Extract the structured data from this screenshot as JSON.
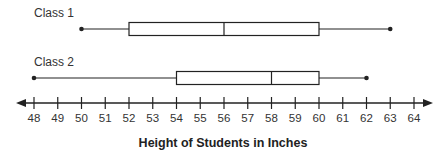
{
  "chart_data": {
    "type": "boxplot",
    "title": "",
    "xlabel": "Height of Students in Inches",
    "ylabel": "",
    "xlim": [
      48,
      64
    ],
    "tick_labels": [
      "48",
      "49",
      "50",
      "51",
      "52",
      "53",
      "54",
      "55",
      "56",
      "57",
      "58",
      "59",
      "60",
      "61",
      "62",
      "63",
      "64"
    ],
    "grid": false,
    "legend": null,
    "series": [
      {
        "name": "Class 1",
        "min": 50,
        "q1": 52,
        "median": 56,
        "q3": 60,
        "max": 63
      },
      {
        "name": "Class 2",
        "min": 48,
        "q1": 54,
        "median": 58,
        "q3": 60,
        "max": 62
      }
    ]
  },
  "colors": {
    "ink": "#222222",
    "box_fill": "#ffffff",
    "background": "#ffffff"
  }
}
